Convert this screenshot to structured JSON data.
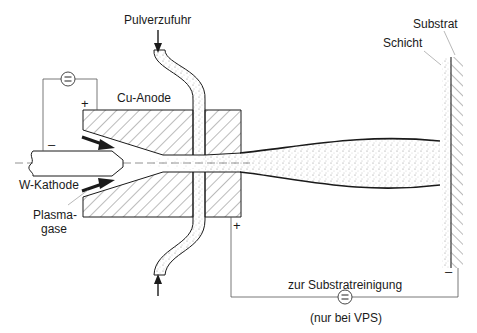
{
  "diagram": {
    "labels": {
      "powder_feed": "Pulverzufuhr",
      "cu_anode": "Cu-Anode",
      "w_cathode": "W-Kathode",
      "plasma_gas_line1": "Plasma-",
      "plasma_gas_line2": "gase",
      "substrate": "Substrat",
      "layer": "Schicht",
      "substrate_cleaning": "zur Substratreinigung",
      "vps_only": "(nur bei VPS)"
    },
    "symbols": {
      "dc_source_top": "=",
      "dc_source_bottom": "=",
      "plus_top": "+",
      "minus_top": "–",
      "plus_bottom": "+",
      "minus_bottom": "–"
    },
    "colors": {
      "line": "#1a1a1a",
      "hatch": "#444444",
      "background": "#ffffff"
    }
  }
}
